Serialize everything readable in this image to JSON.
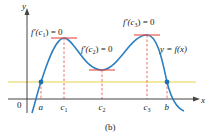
{
  "figure": {
    "caption": "(b)",
    "colors": {
      "curve": "#2e7fc0",
      "tangent": "#e8483f",
      "dashed": "#e8483f",
      "horizontal_line": "#e8d44a",
      "axis": "#444444",
      "point": "#1f6fb0",
      "text": "#222222"
    },
    "axes": {
      "x_label": "x",
      "y_label": "y",
      "origin_label": "0"
    },
    "x_ticks": [
      {
        "id": "a",
        "label": "a",
        "sub": ""
      },
      {
        "id": "c1",
        "label": "c",
        "sub": "1"
      },
      {
        "id": "c2",
        "label": "c",
        "sub": "2"
      },
      {
        "id": "c3",
        "label": "c",
        "sub": "3"
      },
      {
        "id": "b",
        "label": "b",
        "sub": ""
      }
    ],
    "annotations": {
      "c1": {
        "prefix": "f′(c",
        "sub": "1",
        "suffix": ") = 0"
      },
      "c2": {
        "prefix": "f′(c",
        "sub": "2",
        "suffix": ") = 0"
      },
      "c3": {
        "prefix": "f′(c",
        "sub": "3",
        "suffix": ") = 0"
      },
      "curve": "y = f(x)"
    }
  }
}
